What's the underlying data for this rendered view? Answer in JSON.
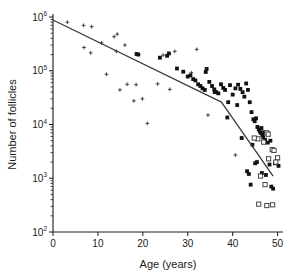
{
  "chart_data": {
    "type": "scatter",
    "title": "",
    "xlabel": "Age (years)",
    "ylabel": "Number of follicles",
    "xlim": [
      0,
      51
    ],
    "ylim": [
      100,
      1000000
    ],
    "yscale": "log",
    "xscale": "linear",
    "grid": false,
    "legend": "none",
    "xticks": [
      0,
      10,
      20,
      30,
      40,
      50
    ],
    "xtick_labels": [
      "0",
      "10",
      "20",
      "30",
      "40",
      "50"
    ],
    "yticks": [
      100,
      1000,
      10000,
      100000,
      1000000
    ],
    "ytick_labels": [
      "10",
      "10",
      "10",
      "10",
      "10"
    ],
    "ytick_exponents": [
      "2",
      "3",
      "4",
      "5",
      "6"
    ],
    "minor_ticks": "log decades",
    "series": [
      {
        "name": "cross-markers",
        "marker": "cross",
        "points": [
          [
            6.8,
            700000
          ],
          [
            8.6,
            660000
          ],
          [
            13.6,
            430000
          ],
          [
            14.3,
            480000
          ],
          [
            6.9,
            270000
          ],
          [
            8.4,
            215000
          ],
          [
            14.1,
            230000
          ],
          [
            16.0,
            300000
          ],
          [
            11.9,
            86000
          ],
          [
            14.9,
            44000
          ],
          [
            16.5,
            56000
          ],
          [
            18.5,
            55000
          ],
          [
            18.0,
            27500
          ],
          [
            19.9,
            30000
          ],
          [
            21.0,
            10500
          ],
          [
            24.5,
            195000
          ],
          [
            27.1,
            230000
          ],
          [
            32.0,
            250000
          ],
          [
            23.3,
            57000
          ],
          [
            26.0,
            45000
          ],
          [
            30.8,
            92000
          ],
          [
            34.5,
            15000
          ],
          [
            33.2,
            48000
          ],
          [
            40.6,
            2700
          ],
          [
            3.2,
            800000
          ],
          [
            10.8,
            330000
          ]
        ]
      },
      {
        "name": "filled-square-markers",
        "marker": "filled-square",
        "points": [
          [
            18.6,
            205000
          ],
          [
            19.0,
            200000
          ],
          [
            23.8,
            175000
          ],
          [
            25.4,
            190000
          ],
          [
            25.8,
            210000
          ],
          [
            27.6,
            110000
          ],
          [
            30.0,
            78000
          ],
          [
            30.6,
            82000
          ],
          [
            31.2,
            70000
          ],
          [
            31.7,
            66000
          ],
          [
            32.3,
            56000
          ],
          [
            32.8,
            52000
          ],
          [
            33.3,
            47000
          ],
          [
            33.8,
            44000
          ],
          [
            34.2,
            108000
          ],
          [
            34.8,
            62000
          ],
          [
            35.4,
            52000
          ],
          [
            35.9,
            45000
          ],
          [
            36.3,
            40000
          ],
          [
            36.8,
            38000
          ],
          [
            37.4,
            56000
          ],
          [
            37.9,
            48000
          ],
          [
            38.3,
            44000
          ],
          [
            38.8,
            13500
          ],
          [
            39.4,
            54000
          ],
          [
            40.0,
            36000
          ],
          [
            40.6,
            47000
          ],
          [
            41.2,
            55000
          ],
          [
            41.7,
            46000
          ],
          [
            42.2,
            40000
          ],
          [
            42.6,
            33000
          ],
          [
            43.0,
            58000
          ],
          [
            43.4,
            44000
          ],
          [
            43.8,
            26000
          ],
          [
            44.2,
            17000
          ],
          [
            44.6,
            12500
          ],
          [
            44.9,
            11500
          ],
          [
            45.2,
            13000
          ],
          [
            45.5,
            9000
          ],
          [
            45.8,
            8200
          ],
          [
            46.0,
            7600
          ],
          [
            46.2,
            7000
          ],
          [
            46.4,
            8600
          ],
          [
            46.6,
            6400
          ],
          [
            46.8,
            5800
          ],
          [
            47.0,
            7200
          ],
          [
            47.2,
            5200
          ],
          [
            43.2,
            1350
          ],
          [
            43.6,
            1200
          ],
          [
            44.0,
            760
          ],
          [
            45.0,
            1900
          ],
          [
            45.4,
            2000
          ],
          [
            46.5,
            1250
          ],
          [
            47.4,
            1150
          ],
          [
            48.2,
            1800
          ],
          [
            48.6,
            700
          ],
          [
            49.0,
            640
          ],
          [
            49.4,
            1900
          ],
          [
            50.2,
            1700
          ],
          [
            44.4,
            4200
          ],
          [
            47.8,
            4600
          ],
          [
            48.4,
            5000
          ],
          [
            42.0,
            5600
          ],
          [
            41.0,
            23000
          ],
          [
            39.0,
            26000
          ],
          [
            36.0,
            40000
          ],
          [
            34.0,
            95000
          ],
          [
            29.0,
            96000
          ]
        ]
      },
      {
        "name": "open-square-markers",
        "marker": "open-square",
        "points": [
          [
            47.6,
            7000
          ],
          [
            47.9,
            6600
          ],
          [
            45.6,
            5400
          ],
          [
            46.9,
            4700
          ],
          [
            48.8,
            3400
          ],
          [
            49.2,
            3300
          ],
          [
            50.0,
            2400
          ],
          [
            48.0,
            2300
          ],
          [
            46.2,
            1100
          ],
          [
            47.2,
            760
          ],
          [
            45.8,
            330
          ],
          [
            47.6,
            310
          ],
          [
            48.9,
            320
          ],
          [
            44.8,
            5600
          ],
          [
            49.6,
            2000
          ]
        ]
      }
    ],
    "fit_line": {
      "name": "biphasic-fit",
      "segments": [
        [
          0,
          880000
        ],
        [
          37.5,
          26000
        ],
        [
          49.0,
          1100
        ]
      ],
      "breakpoint_age": 37.5,
      "breakpoint_value": 26000
    }
  }
}
